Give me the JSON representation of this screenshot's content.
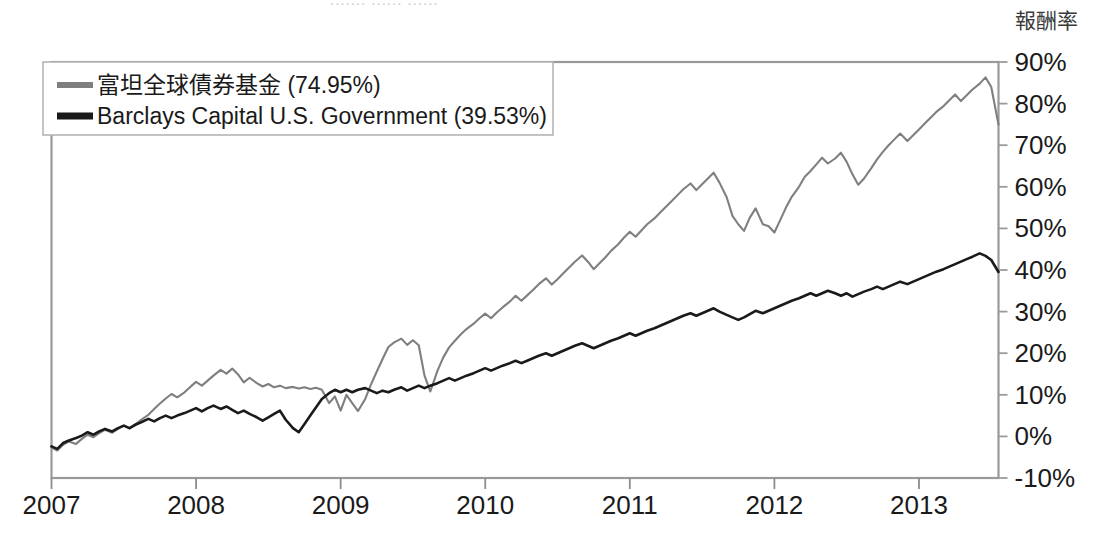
{
  "figure": {
    "cropped_title_sliver": "....... ...... ......",
    "axis_title_right": "報酬率",
    "plot_border_color": "#9a9a9a",
    "background": "#ffffff"
  },
  "legend": {
    "position": "top-left-inside",
    "border_color": "#b5b5b5",
    "entries": [
      {
        "label": "富坦全球債券基金 (74.95%)",
        "color": "#7f7f7f",
        "name": "templeton-global-bond-fund"
      },
      {
        "label": "Barclays Capital U.S. Government (39.53%)",
        "color": "#1a1a1a",
        "name": "barclays-capital-us-government"
      }
    ]
  },
  "chart_data": {
    "type": "line",
    "title": "",
    "subtitle": "",
    "xlabel": "",
    "ylabel": "報酬率",
    "grid": false,
    "legend_position": "top-left",
    "xlim": [
      2007.0,
      2013.55
    ],
    "ylim": [
      -10,
      90
    ],
    "ytick_labels": [
      "90%",
      "80%",
      "70%",
      "60%",
      "50%",
      "40%",
      "30%",
      "20%",
      "10%",
      "0%",
      "-10%"
    ],
    "ytick_values": [
      90,
      80,
      70,
      60,
      50,
      40,
      30,
      20,
      10,
      0,
      -10
    ],
    "ytick_suffix": "%",
    "xtick_labels": [
      "2007",
      "2008",
      "2009",
      "2010",
      "2011",
      "2012",
      "2013"
    ],
    "xtick_values": [
      2007,
      2008,
      2009,
      2010,
      2011,
      2012,
      2013
    ],
    "final_values": {
      "富坦全球債券基金": 74.95,
      "Barclays Capital U.S. Government": 39.53
    },
    "series": [
      {
        "name": "富坦全球債券基金",
        "label": "富坦全球債券基金 (74.95%)",
        "color": "#7f7f7f",
        "width": 2.1,
        "final_value": 74.95,
        "x": [
          2007.0,
          2007.04,
          2007.08,
          2007.12,
          2007.17,
          2007.21,
          2007.25,
          2007.29,
          2007.33,
          2007.37,
          2007.42,
          2007.46,
          2007.5,
          2007.54,
          2007.58,
          2007.62,
          2007.67,
          2007.71,
          2007.75,
          2007.79,
          2007.83,
          2007.87,
          2007.92,
          2007.96,
          2008.0,
          2008.04,
          2008.08,
          2008.12,
          2008.17,
          2008.21,
          2008.25,
          2008.29,
          2008.33,
          2008.37,
          2008.42,
          2008.46,
          2008.5,
          2008.54,
          2008.58,
          2008.62,
          2008.67,
          2008.71,
          2008.75,
          2008.79,
          2008.83,
          2008.87,
          2008.92,
          2008.96,
          2009.0,
          2009.04,
          2009.08,
          2009.12,
          2009.17,
          2009.21,
          2009.25,
          2009.29,
          2009.33,
          2009.37,
          2009.42,
          2009.46,
          2009.5,
          2009.54,
          2009.58,
          2009.62,
          2009.67,
          2009.71,
          2009.75,
          2009.79,
          2009.83,
          2009.87,
          2009.92,
          2009.96,
          2010.0,
          2010.04,
          2010.08,
          2010.12,
          2010.17,
          2010.21,
          2010.25,
          2010.29,
          2010.33,
          2010.37,
          2010.42,
          2010.46,
          2010.5,
          2010.54,
          2010.58,
          2010.62,
          2010.67,
          2010.71,
          2010.75,
          2010.79,
          2010.83,
          2010.87,
          2010.92,
          2010.96,
          2011.0,
          2011.04,
          2011.08,
          2011.12,
          2011.17,
          2011.21,
          2011.25,
          2011.29,
          2011.33,
          2011.37,
          2011.42,
          2011.46,
          2011.5,
          2011.54,
          2011.58,
          2011.62,
          2011.67,
          2011.71,
          2011.75,
          2011.79,
          2011.83,
          2011.87,
          2011.92,
          2011.96,
          2012.0,
          2012.04,
          2012.08,
          2012.12,
          2012.17,
          2012.21,
          2012.25,
          2012.29,
          2012.33,
          2012.37,
          2012.42,
          2012.46,
          2012.5,
          2012.54,
          2012.58,
          2012.62,
          2012.67,
          2012.71,
          2012.75,
          2012.79,
          2012.83,
          2012.87,
          2012.92,
          2012.96,
          2013.0,
          2013.04,
          2013.08,
          2013.12,
          2013.17,
          2013.21,
          2013.25,
          2013.29,
          2013.33,
          2013.37,
          2013.42,
          2013.46,
          2013.5,
          2013.55
        ],
        "y": [
          -2.6,
          -3.4,
          -2.0,
          -1.2,
          -1.8,
          -0.6,
          0.4,
          -0.2,
          0.8,
          1.6,
          0.9,
          1.8,
          2.6,
          1.9,
          2.9,
          4.0,
          5.2,
          6.6,
          7.9,
          9.1,
          10.2,
          9.4,
          10.6,
          11.9,
          13.1,
          12.2,
          13.4,
          14.6,
          16.0,
          15.1,
          16.3,
          14.9,
          13.0,
          14.1,
          12.8,
          12.0,
          12.6,
          11.8,
          12.2,
          11.6,
          11.9,
          11.5,
          11.8,
          11.4,
          11.7,
          11.2,
          8.0,
          9.6,
          6.2,
          10.0,
          8.0,
          6.1,
          9.0,
          12.5,
          15.6,
          18.6,
          21.5,
          22.6,
          23.5,
          22.0,
          23.1,
          21.9,
          14.6,
          10.8,
          15.8,
          19.0,
          21.4,
          23.0,
          24.5,
          25.8,
          27.1,
          28.4,
          29.5,
          28.4,
          29.8,
          31.0,
          32.4,
          33.8,
          32.6,
          33.9,
          35.2,
          36.6,
          38.0,
          36.5,
          37.8,
          39.2,
          40.6,
          42.0,
          43.5,
          42.0,
          40.2,
          41.6,
          43.0,
          44.6,
          46.2,
          47.8,
          49.2,
          48.0,
          49.5,
          51.0,
          52.4,
          53.8,
          55.2,
          56.6,
          58.0,
          59.4,
          60.8,
          59.2,
          60.6,
          62.0,
          63.4,
          61.0,
          57.5,
          53.0,
          51.0,
          49.4,
          52.6,
          54.8,
          51.0,
          50.5,
          49.0,
          52.0,
          55.0,
          57.6,
          60.0,
          62.4,
          63.8,
          65.4,
          67.0,
          65.6,
          66.8,
          68.2,
          66.0,
          63.0,
          60.5,
          62.0,
          64.5,
          66.6,
          68.4,
          70.0,
          71.4,
          72.8,
          71.0,
          72.4,
          73.8,
          75.2,
          76.6,
          78.0,
          79.4,
          80.8,
          82.2,
          80.6,
          82.0,
          83.4,
          84.8,
          86.3,
          84.0,
          74.95
        ]
      },
      {
        "name": "Barclays Capital U.S. Government",
        "label": "Barclays Capital U.S. Government (39.53%)",
        "color": "#1a1a1a",
        "width": 2.6,
        "final_value": 39.53,
        "x": [
          2007.0,
          2007.04,
          2007.08,
          2007.12,
          2007.17,
          2007.21,
          2007.25,
          2007.29,
          2007.33,
          2007.37,
          2007.42,
          2007.46,
          2007.5,
          2007.54,
          2007.58,
          2007.62,
          2007.67,
          2007.71,
          2007.75,
          2007.79,
          2007.83,
          2007.87,
          2007.92,
          2007.96,
          2008.0,
          2008.04,
          2008.08,
          2008.12,
          2008.17,
          2008.21,
          2008.25,
          2008.29,
          2008.33,
          2008.37,
          2008.42,
          2008.46,
          2008.5,
          2008.54,
          2008.58,
          2008.62,
          2008.67,
          2008.71,
          2008.75,
          2008.79,
          2008.83,
          2008.87,
          2008.92,
          2008.96,
          2009.0,
          2009.04,
          2009.08,
          2009.12,
          2009.17,
          2009.21,
          2009.25,
          2009.29,
          2009.33,
          2009.37,
          2009.42,
          2009.46,
          2009.5,
          2009.54,
          2009.58,
          2009.62,
          2009.67,
          2009.71,
          2009.75,
          2009.79,
          2009.83,
          2009.87,
          2009.92,
          2009.96,
          2010.0,
          2010.04,
          2010.08,
          2010.12,
          2010.17,
          2010.21,
          2010.25,
          2010.29,
          2010.33,
          2010.37,
          2010.42,
          2010.46,
          2010.5,
          2010.54,
          2010.58,
          2010.62,
          2010.67,
          2010.71,
          2010.75,
          2010.79,
          2010.83,
          2010.87,
          2010.92,
          2010.96,
          2011.0,
          2011.04,
          2011.08,
          2011.12,
          2011.17,
          2011.21,
          2011.25,
          2011.29,
          2011.33,
          2011.37,
          2011.42,
          2011.46,
          2011.5,
          2011.54,
          2011.58,
          2011.62,
          2011.67,
          2011.71,
          2011.75,
          2011.79,
          2011.83,
          2011.87,
          2011.92,
          2011.96,
          2012.0,
          2012.04,
          2012.08,
          2012.12,
          2012.17,
          2012.21,
          2012.25,
          2012.29,
          2012.33,
          2012.37,
          2012.42,
          2012.46,
          2012.5,
          2012.54,
          2012.58,
          2012.62,
          2012.67,
          2012.71,
          2012.75,
          2012.79,
          2012.83,
          2012.87,
          2012.92,
          2012.96,
          2013.0,
          2013.04,
          2013.08,
          2013.12,
          2013.17,
          2013.21,
          2013.25,
          2013.29,
          2013.33,
          2013.37,
          2013.42,
          2013.46,
          2013.5,
          2013.55
        ],
        "y": [
          -2.4,
          -3.0,
          -1.6,
          -1.0,
          -0.4,
          0.2,
          1.0,
          0.4,
          1.2,
          1.8,
          1.2,
          2.0,
          2.6,
          2.0,
          2.8,
          3.4,
          4.2,
          3.6,
          4.4,
          5.0,
          4.4,
          5.0,
          5.6,
          6.2,
          6.8,
          6.0,
          6.8,
          7.4,
          6.6,
          7.2,
          6.4,
          5.6,
          6.2,
          5.4,
          4.6,
          3.8,
          4.6,
          5.4,
          6.2,
          4.0,
          2.0,
          1.0,
          3.0,
          5.0,
          7.0,
          9.0,
          10.4,
          11.2,
          10.6,
          11.2,
          10.6,
          11.2,
          11.6,
          11.0,
          10.4,
          11.0,
          10.6,
          11.2,
          11.8,
          11.0,
          11.6,
          12.2,
          11.6,
          12.2,
          12.8,
          13.4,
          14.0,
          13.4,
          14.0,
          14.6,
          15.2,
          15.8,
          16.4,
          15.8,
          16.4,
          17.0,
          17.6,
          18.2,
          17.6,
          18.2,
          18.8,
          19.4,
          20.0,
          19.4,
          20.0,
          20.6,
          21.2,
          21.8,
          22.4,
          21.8,
          21.2,
          21.8,
          22.4,
          23.0,
          23.6,
          24.2,
          24.8,
          24.2,
          24.8,
          25.4,
          26.0,
          26.6,
          27.2,
          27.8,
          28.4,
          29.0,
          29.6,
          29.0,
          29.6,
          30.2,
          30.8,
          30.0,
          29.2,
          28.6,
          28.0,
          28.6,
          29.4,
          30.2,
          29.6,
          30.2,
          30.8,
          31.4,
          32.0,
          32.6,
          33.2,
          33.8,
          34.4,
          33.8,
          34.4,
          35.0,
          34.4,
          33.8,
          34.4,
          33.6,
          34.2,
          34.8,
          35.4,
          36.0,
          35.4,
          36.0,
          36.6,
          37.2,
          36.6,
          37.2,
          37.8,
          38.4,
          39.0,
          39.6,
          40.2,
          40.8,
          41.4,
          42.0,
          42.6,
          43.2,
          44.0,
          43.4,
          42.4,
          39.53
        ]
      }
    ]
  }
}
